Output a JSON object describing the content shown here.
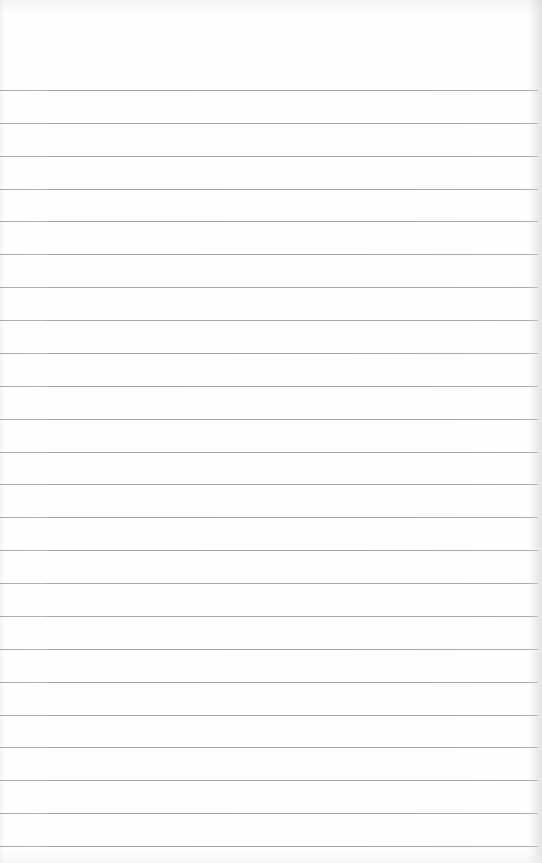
{
  "page": {
    "type": "lined-notepad-sheet",
    "background_color": "#fefefe",
    "line_color": "#a8a8a8",
    "first_line_y": 90,
    "line_spacing": 32.87,
    "line_count": 24,
    "text_lines": []
  }
}
